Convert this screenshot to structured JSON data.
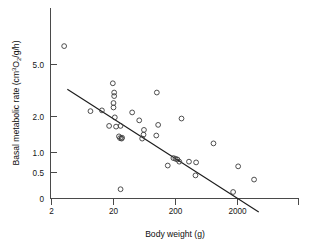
{
  "figure": {
    "background_color": "#ffffff",
    "marker_color": "#3b3b3b",
    "line_color": "#1c1c1c",
    "axis_color": "#4a4a4a"
  },
  "axes": {
    "x_title_prefix": "Body weight (g)",
    "y_title_prefix": "Basal metabolic rate (cm",
    "y_title_sup": "3",
    "y_title_mid": "O",
    "y_title_sub": "2",
    "y_title_suffix": "/g/h)"
  },
  "chart_data": {
    "type": "scatter",
    "title": "",
    "xlabel": "Body weight (g)",
    "ylabel": "Basal metabolic rate (cm3O2/g/h)",
    "xscale": "log",
    "yscale": "log",
    "xlim": [
      2,
      6400
    ],
    "ylim": [
      0.2,
      9.0
    ],
    "grid": false,
    "legend": null,
    "xticks": [
      2,
      20,
      200,
      2000
    ],
    "xticklabels": [
      "2",
      "20",
      "200",
      "2000"
    ],
    "yticks": [
      0.5,
      1.0,
      2.0,
      5.0
    ],
    "yticklabels": [
      "0.5",
      "1.0",
      "2.0",
      "5.0"
    ],
    "y_origin_label": "0",
    "points": [
      {
        "x": 3.2,
        "y": 7.4
      },
      {
        "x": 8.5,
        "y": 1.85
      },
      {
        "x": 13.0,
        "y": 1.88
      },
      {
        "x": 19.5,
        "y": 3.35
      },
      {
        "x": 20.5,
        "y": 2.75
      },
      {
        "x": 20.5,
        "y": 2.55
      },
      {
        "x": 20.0,
        "y": 2.2
      },
      {
        "x": 20.0,
        "y": 2.0
      },
      {
        "x": 21.0,
        "y": 1.62
      },
      {
        "x": 17.0,
        "y": 1.35
      },
      {
        "x": 22.0,
        "y": 1.33
      },
      {
        "x": 26.0,
        "y": 1.35
      },
      {
        "x": 24.5,
        "y": 1.08
      },
      {
        "x": 25.5,
        "y": 1.04
      },
      {
        "x": 27.0,
        "y": 1.03
      },
      {
        "x": 27.5,
        "y": 1.05
      },
      {
        "x": 26.0,
        "y": 0.35
      },
      {
        "x": 40.0,
        "y": 1.8
      },
      {
        "x": 52.0,
        "y": 1.52
      },
      {
        "x": 62.0,
        "y": 1.24
      },
      {
        "x": 58.0,
        "y": 1.03
      },
      {
        "x": 61.0,
        "y": 1.12
      },
      {
        "x": 100.0,
        "y": 2.75
      },
      {
        "x": 105.0,
        "y": 1.38
      },
      {
        "x": 98.0,
        "y": 1.1
      },
      {
        "x": 150.0,
        "y": 0.58
      },
      {
        "x": 185.0,
        "y": 0.68
      },
      {
        "x": 200.0,
        "y": 0.67
      },
      {
        "x": 215.0,
        "y": 0.66
      },
      {
        "x": 230.0,
        "y": 0.63
      },
      {
        "x": 250.0,
        "y": 1.58
      },
      {
        "x": 330.0,
        "y": 0.63
      },
      {
        "x": 430.0,
        "y": 0.62
      },
      {
        "x": 420.0,
        "y": 0.47
      },
      {
        "x": 820.0,
        "y": 0.93
      },
      {
        "x": 1700.0,
        "y": 0.33
      },
      {
        "x": 2050.0,
        "y": 0.57
      },
      {
        "x": 3700.0,
        "y": 0.43
      }
    ],
    "fit_line": {
      "label": "regression line",
      "x_start": 3.6,
      "y_start": 2.95,
      "x_end": 4400.0,
      "y_end": 0.215
    }
  }
}
